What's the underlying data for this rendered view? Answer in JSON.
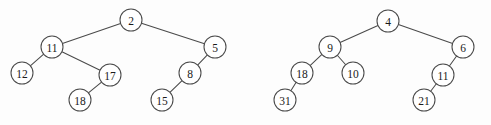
{
  "figure": {
    "width": 491,
    "height": 125,
    "background_color": "#fdfdfd",
    "stroke_color": "#4a4a4a",
    "label_color": "#1a1a1a",
    "node_radius": 11
  },
  "trees": [
    {
      "name": "left-tree",
      "root_value": "2",
      "nodes": [
        {
          "id": "L2",
          "label": "2",
          "cx": 131,
          "cy": 20
        },
        {
          "id": "L11",
          "label": "11",
          "cx": 52,
          "cy": 47
        },
        {
          "id": "L5",
          "label": "5",
          "cx": 215,
          "cy": 47
        },
        {
          "id": "L12",
          "label": "12",
          "cx": 22,
          "cy": 73
        },
        {
          "id": "L17",
          "label": "17",
          "cx": 110,
          "cy": 75
        },
        {
          "id": "L8",
          "label": "8",
          "cx": 190,
          "cy": 73
        },
        {
          "id": "L18",
          "label": "18",
          "cx": 80,
          "cy": 100
        },
        {
          "id": "L15",
          "label": "15",
          "cx": 162,
          "cy": 100
        }
      ],
      "edges": [
        {
          "from": "L2",
          "to": "L11"
        },
        {
          "from": "L2",
          "to": "L5"
        },
        {
          "from": "L11",
          "to": "L12"
        },
        {
          "from": "L11",
          "to": "L17"
        },
        {
          "from": "L17",
          "to": "L18"
        },
        {
          "from": "L5",
          "to": "L8"
        },
        {
          "from": "L8",
          "to": "L15"
        }
      ]
    },
    {
      "name": "right-tree",
      "root_value": "4",
      "nodes": [
        {
          "id": "R4",
          "label": "4",
          "cx": 388,
          "cy": 21
        },
        {
          "id": "R9",
          "label": "9",
          "cx": 330,
          "cy": 47
        },
        {
          "id": "R6",
          "label": "6",
          "cx": 463,
          "cy": 47
        },
        {
          "id": "R18",
          "label": "18",
          "cx": 302,
          "cy": 73
        },
        {
          "id": "R10",
          "label": "10",
          "cx": 353,
          "cy": 73
        },
        {
          "id": "R11",
          "label": "11",
          "cx": 443,
          "cy": 75
        },
        {
          "id": "R31",
          "label": "31",
          "cx": 285,
          "cy": 100
        },
        {
          "id": "R21",
          "label": "21",
          "cx": 424,
          "cy": 100
        }
      ],
      "edges": [
        {
          "from": "R4",
          "to": "R9"
        },
        {
          "from": "R4",
          "to": "R6"
        },
        {
          "from": "R9",
          "to": "R18"
        },
        {
          "from": "R9",
          "to": "R10"
        },
        {
          "from": "R18",
          "to": "R31"
        },
        {
          "from": "R6",
          "to": "R11"
        },
        {
          "from": "R11",
          "to": "R21"
        }
      ]
    }
  ]
}
